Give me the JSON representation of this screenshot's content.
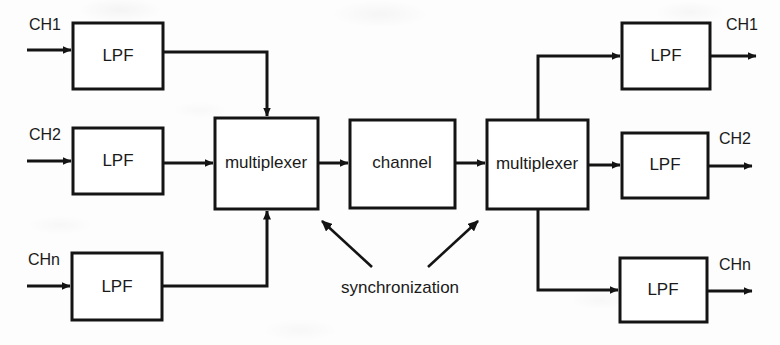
{
  "diagram": {
    "stroke_color": "#141414",
    "fill_color": "#ffffff",
    "background_color": "#fdfdfd",
    "blocks": [
      {
        "id": "lpf_in_1",
        "label": "LPF",
        "x": 73,
        "y": 23,
        "w": 90,
        "h": 66
      },
      {
        "id": "lpf_in_2",
        "label": "LPF",
        "x": 73,
        "y": 128,
        "w": 90,
        "h": 66
      },
      {
        "id": "lpf_in_n",
        "label": "LPF",
        "x": 72,
        "y": 253,
        "w": 90,
        "h": 67
      },
      {
        "id": "mux_tx",
        "label": "multiplexer",
        "x": 215,
        "y": 118,
        "w": 103,
        "h": 91
      },
      {
        "id": "channel",
        "label": "channel",
        "x": 350,
        "y": 120,
        "w": 105,
        "h": 88
      },
      {
        "id": "mux_rx",
        "label": "multiplexer",
        "x": 487,
        "y": 120,
        "w": 101,
        "h": 89
      },
      {
        "id": "lpf_out_1",
        "label": "LPF",
        "x": 622,
        "y": 23,
        "w": 88,
        "h": 66
      },
      {
        "id": "lpf_out_2",
        "label": "LPF",
        "x": 622,
        "y": 133,
        "w": 86,
        "h": 65
      },
      {
        "id": "lpf_out_n",
        "label": "LPF",
        "x": 620,
        "y": 258,
        "w": 87,
        "h": 64
      }
    ],
    "input_labels": [
      {
        "id": "in_ch1",
        "text": "CH1",
        "x": 29,
        "y": 26
      },
      {
        "id": "in_ch2",
        "text": "CH2",
        "x": 29,
        "y": 136
      },
      {
        "id": "in_chn",
        "text": "CHn",
        "x": 28,
        "y": 261
      }
    ],
    "output_labels": [
      {
        "id": "out_ch1",
        "text": "CH1",
        "x": 726,
        "y": 26
      },
      {
        "id": "out_ch2",
        "text": "CH2",
        "x": 719,
        "y": 140
      },
      {
        "id": "out_chn",
        "text": "CHn",
        "x": 719,
        "y": 266
      }
    ],
    "annotation": {
      "id": "synchronization",
      "text": "synchronization",
      "x": 400,
      "y": 289
    }
  }
}
